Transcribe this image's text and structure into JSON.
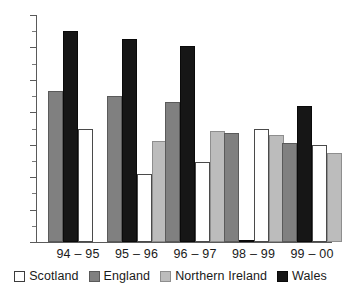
{
  "chart_data": {
    "type": "bar",
    "title": "",
    "subtitle": "",
    "xlabel": "",
    "ylabel": "",
    "categories": [
      "94 – 95",
      "95 – 96",
      "96 – 97",
      "98 – 99",
      "99 – 00"
    ],
    "series": [
      {
        "name": "Scotland",
        "color": "#ffffff",
        "values": [
          7.0,
          4.2,
          4.95,
          6.95,
          6.0
        ]
      },
      {
        "name": "England",
        "color": "#808080",
        "values": [
          9.3,
          9.0,
          8.65,
          6.75,
          6.1
        ]
      },
      {
        "name": "Northern Ireland",
        "color": "#bcbcbc",
        "values": [
          null,
          6.25,
          6.85,
          6.6,
          5.5
        ]
      },
      {
        "name": "Wales",
        "color": "#161616",
        "values": [
          13.0,
          12.5,
          12.1,
          0.1,
          8.4
        ]
      }
    ],
    "draw_order": [
      "England",
      "Wales",
      "Scotland",
      "Northern Ireland"
    ],
    "ylim": [
      0,
      14
    ],
    "yticks": [
      0,
      2,
      4,
      6,
      8,
      10,
      12,
      14
    ],
    "ytick_labels": [
      "0",
      "2",
      "4",
      "6",
      "8",
      "10",
      "12",
      "14"
    ],
    "yminor_ticks": [
      1,
      3,
      5,
      7,
      9,
      11,
      13
    ],
    "grid": false,
    "legend_position": "bottom"
  }
}
